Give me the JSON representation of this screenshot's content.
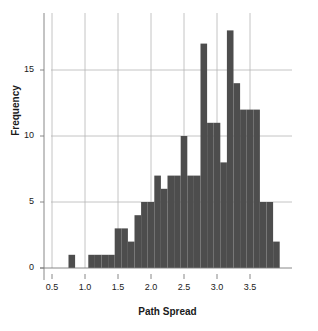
{
  "chart_data": {
    "type": "bar",
    "title": "",
    "xlabel": "Path Spread",
    "ylabel": "Frequency",
    "xlim": [
      0.35,
      4.0
    ],
    "ylim": [
      0,
      18.8
    ],
    "xticks": [
      "0.5",
      "1.0",
      "1.5",
      "2.0",
      "2.5",
      "3.0",
      "3.5"
    ],
    "xtick_values": [
      0.5,
      1.0,
      1.5,
      2.0,
      2.5,
      3.0,
      3.5
    ],
    "yticks": [
      "0",
      "5",
      "10",
      "15"
    ],
    "ytick_values": [
      0,
      5,
      10,
      15
    ],
    "grid": "both",
    "bin_width": 0.1,
    "bar_color": "#4d4d4d",
    "grid_color": "#b5b5b5",
    "axis_color": "#7a7a7a",
    "bins": [
      {
        "x0": 0.75,
        "x1": 0.85,
        "value": 1
      },
      {
        "x0": 1.05,
        "x1": 1.15,
        "value": 1
      },
      {
        "x0": 1.15,
        "x1": 1.25,
        "value": 1
      },
      {
        "x0": 1.25,
        "x1": 1.35,
        "value": 1
      },
      {
        "x0": 1.35,
        "x1": 1.45,
        "value": 1
      },
      {
        "x0": 1.45,
        "x1": 1.55,
        "value": 3
      },
      {
        "x0": 1.55,
        "x1": 1.65,
        "value": 3
      },
      {
        "x0": 1.65,
        "x1": 1.75,
        "value": 2
      },
      {
        "x0": 1.75,
        "x1": 1.85,
        "value": 4
      },
      {
        "x0": 1.85,
        "x1": 1.95,
        "value": 5
      },
      {
        "x0": 1.95,
        "x1": 2.05,
        "value": 5
      },
      {
        "x0": 2.05,
        "x1": 2.15,
        "value": 7
      },
      {
        "x0": 2.15,
        "x1": 2.25,
        "value": 6
      },
      {
        "x0": 2.25,
        "x1": 2.35,
        "value": 7
      },
      {
        "x0": 2.35,
        "x1": 2.45,
        "value": 7
      },
      {
        "x0": 2.45,
        "x1": 2.55,
        "value": 10
      },
      {
        "x0": 2.55,
        "x1": 2.65,
        "value": 7
      },
      {
        "x0": 2.65,
        "x1": 2.75,
        "value": 7
      },
      {
        "x0": 2.75,
        "x1": 2.85,
        "value": 17
      },
      {
        "x0": 2.85,
        "x1": 2.95,
        "value": 11
      },
      {
        "x0": 2.95,
        "x1": 3.05,
        "value": 11
      },
      {
        "x0": 3.05,
        "x1": 3.15,
        "value": 8
      },
      {
        "x0": 3.15,
        "x1": 3.25,
        "value": 18
      },
      {
        "x0": 3.25,
        "x1": 3.35,
        "value": 14
      },
      {
        "x0": 3.35,
        "x1": 3.45,
        "value": 12
      },
      {
        "x0": 3.45,
        "x1": 3.55,
        "value": 12
      },
      {
        "x0": 3.55,
        "x1": 3.65,
        "value": 12
      },
      {
        "x0": 3.65,
        "x1": 3.75,
        "value": 5
      },
      {
        "x0": 3.75,
        "x1": 3.85,
        "value": 5
      },
      {
        "x0": 3.85,
        "x1": 3.95,
        "value": 2
      }
    ]
  }
}
